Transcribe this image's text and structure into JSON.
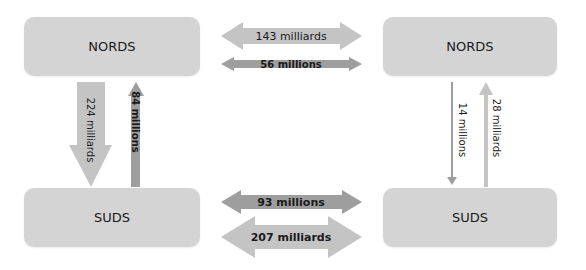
{
  "diagram": {
    "colors": {
      "box": "#d4d4d4",
      "light_arrow": "#c4c4c4",
      "dark_arrow": "#9e9e9e",
      "text": "#1a1a1a"
    },
    "left": {
      "top_box": "NORDS",
      "bottom_box": "SUDS",
      "down_arrow": "224 milliards",
      "up_arrow": "84 millions"
    },
    "right": {
      "top_box": "NORDS",
      "bottom_box": "SUDS",
      "down_arrow": "14 millions",
      "up_arrow": "28 milliards"
    },
    "middle": {
      "top_large": "143 milliards",
      "top_small": "56 millions",
      "bottom_small": "93 millions",
      "bottom_large": "207 milliards"
    }
  }
}
